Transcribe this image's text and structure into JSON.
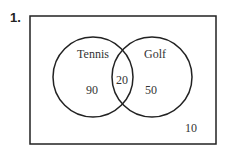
{
  "question": {
    "number": "1."
  },
  "diagram": {
    "type": "venn",
    "sets": [
      {
        "label": "Tennis",
        "only_value": "90"
      },
      {
        "label": "Golf",
        "only_value": "50"
      }
    ],
    "intersection": "20",
    "outside": "10"
  },
  "colors": {
    "stroke": "#222222",
    "background": "#ffffff"
  }
}
